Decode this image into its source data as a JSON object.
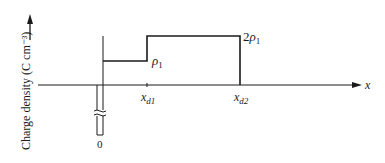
{
  "diagram": {
    "type": "charge_density_profile",
    "y_axis": {
      "label": "Charge density (C cm⁻³)"
    },
    "x_axis": {
      "label": "x"
    },
    "origin_label": "0",
    "levels": [
      {
        "label_main": "ρ",
        "label_sub": "1",
        "value_rel": 1
      },
      {
        "label_prefix": "2",
        "label_main": "ρ",
        "label_sub": "1",
        "value_rel": 2
      }
    ],
    "x_marks": [
      {
        "label_main": "x",
        "label_sub": "d1"
      },
      {
        "label_main": "x",
        "label_sub": "d2"
      }
    ],
    "colors": {
      "line": "#1a1a1a",
      "background": "#ffffff"
    }
  }
}
